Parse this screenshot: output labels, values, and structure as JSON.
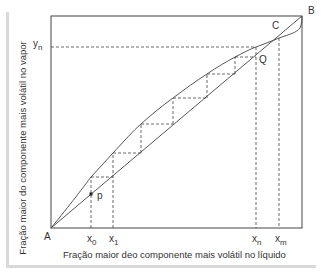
{
  "diagram": {
    "type": "mccabe-thiele-azeotrope",
    "axes": {
      "xlabel": "Fração maior deo componente mais volátil no líquido",
      "ylabel": "Fração maior do componente mais volátil no vapor"
    },
    "points": {
      "A": "A",
      "B": "B",
      "C": "C",
      "Q": "Q",
      "p": "p"
    },
    "x_ticks": [
      {
        "base": "x",
        "sub": "0"
      },
      {
        "base": "x",
        "sub": "1"
      },
      {
        "base": "x",
        "sub": "n"
      },
      {
        "base": "x",
        "sub": "m"
      }
    ],
    "y_ticks": [
      {
        "base": "y",
        "sub": "n"
      }
    ],
    "colors": {
      "line": "#444444",
      "frame_shadow": "#d9d9d9"
    }
  }
}
